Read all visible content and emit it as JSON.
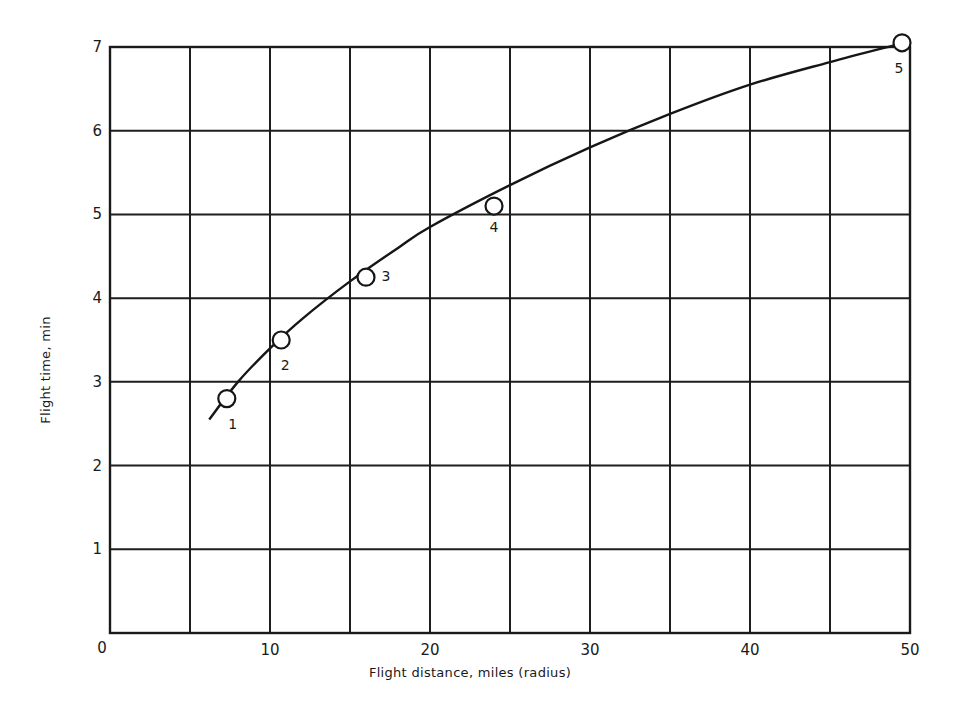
{
  "chart_data": {
    "type": "line",
    "title": "",
    "xlabel": "Flight distance, miles (radius)",
    "ylabel": "Flight time, min",
    "xlim": [
      0,
      50
    ],
    "ylim": [
      0,
      7
    ],
    "grid": true,
    "x_gridlines": [
      0,
      5,
      10,
      15,
      20,
      25,
      30,
      35,
      40,
      45,
      50
    ],
    "y_gridlines": [
      0,
      1,
      2,
      3,
      4,
      5,
      6,
      7
    ],
    "x_tick_labels": [
      "0",
      "10",
      "20",
      "30",
      "40",
      "50"
    ],
    "x_tick_values": [
      0,
      10,
      20,
      30,
      40,
      50
    ],
    "y_tick_labels": [
      "1",
      "2",
      "3",
      "4",
      "5",
      "6",
      "7"
    ],
    "y_tick_values": [
      1,
      2,
      3,
      4,
      5,
      6,
      7
    ],
    "legend": null,
    "series": [
      {
        "name": "Measured flights",
        "style": "open-circle markers",
        "points": [
          {
            "label": "1",
            "x": 7.3,
            "y": 2.8
          },
          {
            "label": "2",
            "x": 10.7,
            "y": 3.5
          },
          {
            "label": "3",
            "x": 16.0,
            "y": 4.25
          },
          {
            "label": "4",
            "x": 24.0,
            "y": 5.1
          },
          {
            "label": "5",
            "x": 49.5,
            "y": 7.05
          }
        ]
      },
      {
        "name": "Fitted curve",
        "style": "solid line",
        "points": [
          {
            "x": 6.2,
            "y": 2.55
          },
          {
            "x": 8,
            "y": 3.0
          },
          {
            "x": 10,
            "y": 3.4
          },
          {
            "x": 12,
            "y": 3.75
          },
          {
            "x": 15,
            "y": 4.2
          },
          {
            "x": 18,
            "y": 4.6
          },
          {
            "x": 20,
            "y": 4.85
          },
          {
            "x": 25,
            "y": 5.35
          },
          {
            "x": 30,
            "y": 5.8
          },
          {
            "x": 35,
            "y": 6.2
          },
          {
            "x": 40,
            "y": 6.55
          },
          {
            "x": 45,
            "y": 6.82
          },
          {
            "x": 49,
            "y": 7.02
          }
        ]
      }
    ],
    "point_label_offsets": {
      "1": [
        6,
        30
      ],
      "2": [
        4,
        30
      ],
      "3": [
        20,
        4
      ],
      "4": [
        0,
        26
      ],
      "5": [
        -3,
        30
      ]
    }
  }
}
